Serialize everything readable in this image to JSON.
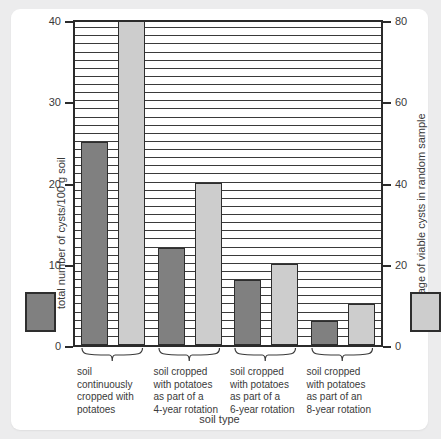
{
  "chart_data": {
    "type": "bar",
    "title": "",
    "xlabel": "soil type",
    "ylabel": "total number of cysts/100 g soil",
    "y2label": "percentage of viable cysts in random sample",
    "ylim": [
      0,
      40
    ],
    "y2lim": [
      0,
      80
    ],
    "yticks": [
      "0",
      "10",
      "20",
      "30",
      "40"
    ],
    "ytick_values": [
      0,
      10,
      20,
      30,
      40
    ],
    "y2ticks": [
      "0",
      "20",
      "40",
      "60",
      "80"
    ],
    "y2tick_values": [
      0,
      20,
      40,
      60,
      80
    ],
    "grid": "horizontal gridlines every 1 unit of left axis",
    "legend_position": "outside left and right of plot, vertically centered low",
    "categories": [
      "soil continuously cropped with potatoes",
      "soil cropped with potatoes as part of a 4-year rotation",
      "soil cropped with potatoes as part of a 6-year rotation",
      "soil cropped with potatoes as part of an 8-year rotation"
    ],
    "category_lines": [
      [
        "soil",
        "continuously",
        "cropped with",
        "potatoes"
      ],
      [
        "soil cropped",
        "with potatoes",
        "as part of a",
        "4-year rotation"
      ],
      [
        "soil cropped",
        "with potatoes",
        "as part of a",
        "6-year rotation"
      ],
      [
        "soil cropped",
        "with potatoes",
        "as part of an",
        "8-year rotation"
      ]
    ],
    "series": [
      {
        "name": "total number of cysts/100 g soil",
        "axis": "left",
        "color": "#808080",
        "values": [
          25,
          12,
          8,
          3
        ]
      },
      {
        "name": "percentage of viable cysts in random sample",
        "axis": "right",
        "color": "#cdcdcd",
        "values": [
          80,
          40,
          20,
          10
        ]
      }
    ]
  },
  "colors": {
    "dark_bar": "#808080",
    "light_bar": "#cdcdcd",
    "axis": "#2b2b2b",
    "text": "#3a3a3a",
    "card": "#ffffff",
    "page_background": "#ececed"
  }
}
